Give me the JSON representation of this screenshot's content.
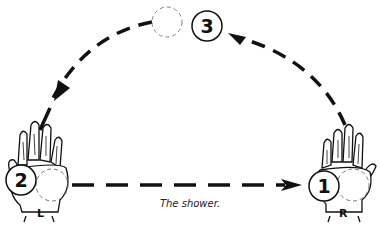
{
  "diagram": {
    "title": "The shower.",
    "pattern": "shower",
    "colors": {
      "ink": "#111111",
      "background": "#ffffff",
      "dashed_ball": "#777777"
    },
    "hands": [
      {
        "id": "left",
        "label": "L"
      },
      {
        "id": "right",
        "label": "R"
      }
    ],
    "balls": [
      {
        "number": "1",
        "position": "right hand"
      },
      {
        "number": "2",
        "position": "left hand"
      },
      {
        "number": "3",
        "position": "top of arc"
      }
    ],
    "paths": [
      {
        "from": "right hand",
        "to": "top of arc",
        "style": "dashed arrow"
      },
      {
        "from": "top of arc",
        "to": "left hand",
        "style": "dashed arrow"
      },
      {
        "from": "left hand",
        "to": "right hand",
        "style": "dashed arrow, straight"
      }
    ]
  }
}
